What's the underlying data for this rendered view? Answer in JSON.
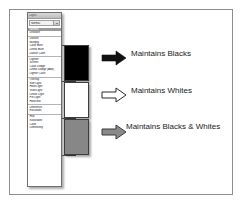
{
  "figure": {
    "title_note": "Photoshop blend mode groups callout diagram"
  },
  "dropdown": {
    "panel_title": "Layers",
    "selected_value": "Normal",
    "groups": [
      {
        "name": "normal-group",
        "items": [
          {
            "label": "Normal",
            "selected": true
          },
          {
            "label": "Dissolve",
            "selected": false
          }
        ]
      },
      {
        "name": "darken-group",
        "items": [
          {
            "label": "Darken",
            "selected": false
          },
          {
            "label": "Multiply",
            "selected": false
          },
          {
            "label": "Color Burn",
            "selected": false
          },
          {
            "label": "Linear Burn",
            "selected": false
          },
          {
            "label": "Darker Color",
            "selected": false
          }
        ]
      },
      {
        "name": "lighten-group",
        "items": [
          {
            "label": "Lighten",
            "selected": false
          },
          {
            "label": "Screen",
            "selected": false
          },
          {
            "label": "Color Dodge",
            "selected": false
          },
          {
            "label": "Linear Dodge (Add)",
            "selected": false
          },
          {
            "label": "Lighter Color",
            "selected": false
          }
        ]
      },
      {
        "name": "contrast-group",
        "items": [
          {
            "label": "Overlay",
            "selected": false
          },
          {
            "label": "Soft Light",
            "selected": false
          },
          {
            "label": "Hard Light",
            "selected": false
          },
          {
            "label": "Vivid Light",
            "selected": false
          },
          {
            "label": "Linear Light",
            "selected": false
          },
          {
            "label": "Pin Light",
            "selected": false
          },
          {
            "label": "Hard Mix",
            "selected": false
          }
        ]
      },
      {
        "name": "comparative-group",
        "items": [
          {
            "label": "Difference",
            "selected": false
          },
          {
            "label": "Exclusion",
            "selected": false
          }
        ]
      },
      {
        "name": "component-group",
        "items": [
          {
            "label": "Hue",
            "selected": false
          },
          {
            "label": "Saturation",
            "selected": false
          },
          {
            "label": "Color",
            "selected": false
          },
          {
            "label": "Luminosity",
            "selected": false
          }
        ]
      }
    ]
  },
  "callouts": [
    {
      "name": "maintains-blacks",
      "swatch_color": "#000000",
      "arrow_style": "solid-black",
      "label": "Maintains Blacks"
    },
    {
      "name": "maintains-whites",
      "swatch_color": "#ffffff",
      "arrow_style": "outline-white",
      "label": "Maintains Whites"
    },
    {
      "name": "maintains-blacks-and-whites",
      "swatch_color": "#878787",
      "arrow_style": "solid-gray",
      "label": "Maintains Blacks & Whites"
    }
  ],
  "colors": {
    "frame_border": "#8d8d8d",
    "panel_border": "#6f6f6f",
    "selected_row_bg": "#9a9a9a",
    "connector": "#4a4a4a"
  }
}
